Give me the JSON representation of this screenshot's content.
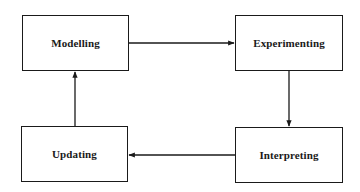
{
  "diagram": {
    "title": "",
    "line_color": "#1a1a1a",
    "nodes": [
      {
        "id": "modelling",
        "label": "Modelling",
        "x": 22,
        "y": 15,
        "w": 107,
        "h": 56
      },
      {
        "id": "experimenting",
        "label": "Experimenting",
        "x": 235,
        "y": 15,
        "w": 108,
        "h": 56
      },
      {
        "id": "interpreting",
        "label": "Interpreting",
        "x": 235,
        "y": 127,
        "w": 108,
        "h": 56
      },
      {
        "id": "updating",
        "label": "Updating",
        "x": 21,
        "y": 126,
        "w": 107,
        "h": 56
      }
    ],
    "edges": [
      {
        "from": "modelling",
        "to": "experimenting",
        "direction": "right"
      },
      {
        "from": "experimenting",
        "to": "interpreting",
        "direction": "down"
      },
      {
        "from": "interpreting",
        "to": "updating",
        "direction": "left"
      },
      {
        "from": "updating",
        "to": "modelling",
        "direction": "up"
      }
    ]
  }
}
